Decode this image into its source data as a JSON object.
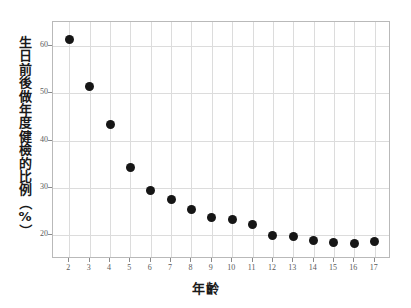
{
  "chart_data": {
    "type": "scatter",
    "title": "",
    "xlabel": "年齡",
    "ylabel": "生日前後做年度健檢的比例（%）",
    "x": [
      2,
      3,
      4,
      5,
      6,
      7,
      8,
      9,
      10,
      11,
      12,
      13,
      14,
      15,
      16,
      17
    ],
    "categories": [
      "2",
      "3",
      "4",
      "5",
      "6",
      "7",
      "8",
      "9",
      "10",
      "11",
      "12",
      "13",
      "14",
      "15",
      "16",
      "17"
    ],
    "values": [
      61.3,
      51.3,
      43.3,
      34.4,
      29.5,
      27.6,
      25.4,
      23.8,
      23.3,
      22.2,
      20.0,
      19.7,
      18.9,
      18.5,
      18.3,
      18.7
    ],
    "series": [
      {
        "name": "生日前後做年度健檢的比例",
        "values": [
          61.3,
          51.3,
          43.3,
          34.4,
          29.5,
          27.6,
          25.4,
          23.8,
          23.3,
          22.2,
          20.0,
          19.7,
          18.9,
          18.5,
          18.3,
          18.7
        ]
      }
    ],
    "xlim": [
      1.2,
      17.8
    ],
    "ylim": [
      15.0,
      65.0
    ],
    "xticks": [
      2,
      3,
      4,
      5,
      6,
      7,
      8,
      9,
      10,
      11,
      12,
      13,
      14,
      15,
      16,
      17
    ],
    "xtick_labels": [
      "2",
      "3",
      "4",
      "5",
      "6",
      "7",
      "8",
      "9",
      "10",
      "11",
      "12",
      "13",
      "14",
      "15",
      "16",
      "17"
    ],
    "yticks": [
      20,
      30,
      40,
      50,
      60
    ],
    "ytick_labels": [
      "20",
      "30",
      "40",
      "50",
      "60"
    ],
    "grid": true,
    "grid_color": "#dcdcdc",
    "legend": null,
    "legend_position": "none",
    "marker": "filled-circle",
    "marker_color": "#161616",
    "background_color": "#ffffff",
    "frame_color": "#b9b9b9",
    "annotations": []
  },
  "ylabel_chars": [
    "生",
    "日",
    "前",
    "後",
    "做",
    "年",
    "度",
    "健",
    "檢",
    "的",
    "比",
    "例",
    "（",
    "%",
    "）"
  ]
}
